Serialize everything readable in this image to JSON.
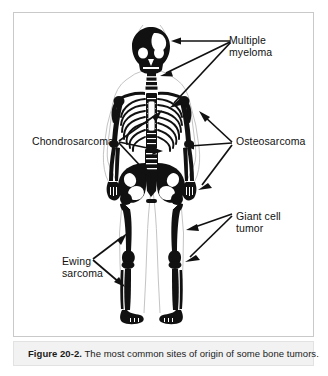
{
  "figure": {
    "caption_number": "Figure 20-2.",
    "caption_text": " The most common sites of origin of some bone tumors.",
    "illustration_alt": "skeleton-anterior-view",
    "colors": {
      "bone": "#111111",
      "background": "#ffffff",
      "soft_tissue": "#d8d8d8",
      "frame": "#c9c9c9",
      "caption_band": "#f2f2f2",
      "text": "#111111"
    }
  },
  "labels": [
    {
      "id": "multiple-myeloma",
      "text": "Multiple\nmyeloma",
      "side": "right",
      "targets": [
        "skull",
        "clavicle-shoulder",
        "ribs"
      ]
    },
    {
      "id": "chondrosarcoma",
      "text": "Chondrosarcoma",
      "side": "left",
      "targets": [
        "pelvis-ilium",
        "proximal-femur"
      ]
    },
    {
      "id": "osteosarcoma",
      "text": "Osteosarcoma",
      "side": "right",
      "targets": [
        "proximal-humerus",
        "pelvis",
        "distal-femur"
      ]
    },
    {
      "id": "giant-cell-tumor",
      "text": "Giant cell\ntumor",
      "side": "right",
      "targets": [
        "distal-femur-knee",
        "proximal-tibia"
      ]
    },
    {
      "id": "ewing-sarcoma",
      "text": "Ewing\nsarcoma",
      "side": "left",
      "targets": [
        "femoral-shaft",
        "tibial-shaft"
      ]
    }
  ]
}
